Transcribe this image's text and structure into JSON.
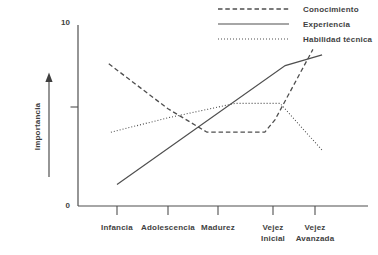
{
  "chart_data": {
    "type": "line",
    "title": "",
    "xlabel": "",
    "ylabel": "Importancia",
    "ylim": [
      0,
      10
    ],
    "y_axis": {
      "title": "Importancia",
      "max_label": "10",
      "min_label": "0",
      "has_unlabeled_mid_tick": true
    },
    "grid": false,
    "legend_position": "top-right",
    "line_color": "#4f4f4f",
    "categories": [
      "Infancia",
      "Adolescencia",
      "Madurez",
      "Vejez\nInicial",
      "Vejez\nAvanzada"
    ],
    "series": [
      {
        "name": "Conocimiento",
        "line_style": "dashed",
        "values_at_categories": [
          7.9,
          5.4,
          4.2,
          4.5,
          8.7
        ],
        "points": [
          [
            0.84,
            7.9
          ],
          [
            2,
            5.4
          ],
          [
            2.78,
            4.1
          ],
          [
            3.85,
            4.1
          ],
          [
            4.05,
            4.8
          ],
          [
            4.95,
            8.7
          ]
        ]
      },
      {
        "name": "Experiencia",
        "line_style": "solid",
        "values_at_categories": [
          1.2,
          3.2,
          5.0,
          7.4,
          8.2
        ],
        "points": [
          [
            1,
            1.2
          ],
          [
            4.29,
            7.8
          ],
          [
            5.17,
            8.4
          ]
        ]
      },
      {
        "name": "Habilidad técnica",
        "line_style": "dotted",
        "values_at_categories": [
          4.1,
          4.9,
          5.6,
          5.7,
          3.4
        ],
        "points": [
          [
            0.88,
            4.1
          ],
          [
            2,
            4.9
          ],
          [
            3.31,
            5.7
          ],
          [
            4.17,
            5.7
          ],
          [
            5.17,
            3.1
          ]
        ]
      }
    ]
  }
}
